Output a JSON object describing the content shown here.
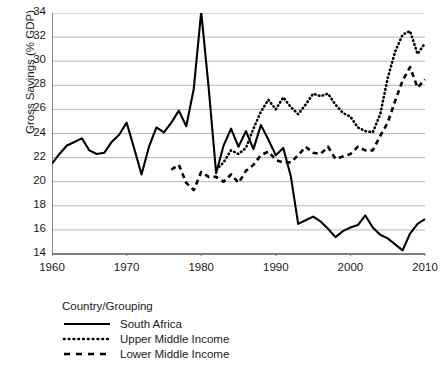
{
  "chart_data": {
    "type": "line",
    "title": "",
    "xlabel": "",
    "ylabel": "Gross Savings (% GDP)",
    "xlim": [
      1960,
      2010
    ],
    "ylim": [
      14,
      34
    ],
    "ytick_step": 2,
    "xtick_step": 10,
    "grid": "horizontal",
    "legend_position": "below-left",
    "legend_title": "Country/Grouping",
    "yticks": [
      "34",
      "32",
      "30",
      "28",
      "26",
      "24",
      "22",
      "20",
      "18",
      "16",
      "14"
    ],
    "xticks": [
      "1960",
      "1970",
      "1980",
      "1990",
      "2000",
      "2010"
    ],
    "series": [
      {
        "name": "South Africa",
        "style": "solid",
        "color": "#000000",
        "x": [
          1960,
          1961,
          1962,
          1963,
          1964,
          1965,
          1966,
          1967,
          1968,
          1969,
          1970,
          1971,
          1972,
          1973,
          1974,
          1975,
          1976,
          1977,
          1978,
          1979,
          1980,
          1981,
          1982,
          1983,
          1984,
          1985,
          1986,
          1987,
          1988,
          1989,
          1990,
          1991,
          1992,
          1993,
          1994,
          1995,
          1996,
          1997,
          1998,
          1999,
          2000,
          2001,
          2002,
          2003,
          2004,
          2005,
          2006,
          2007,
          2008,
          2009,
          2010
        ],
        "values": [
          21.5,
          22.3,
          23.0,
          23.3,
          23.6,
          22.6,
          22.3,
          22.4,
          23.3,
          23.9,
          24.9,
          22.8,
          20.6,
          22.9,
          24.5,
          24.1,
          24.9,
          25.9,
          24.6,
          27.7,
          34.1,
          27.8,
          20.7,
          23.0,
          24.4,
          22.9,
          24.2,
          22.7,
          24.7,
          23.5,
          22.2,
          22.8,
          20.5,
          16.5,
          16.8,
          17.1,
          16.7,
          16.1,
          15.4,
          15.9,
          16.2,
          16.4,
          17.2,
          16.2,
          15.6,
          15.3,
          14.8,
          14.3,
          15.7,
          16.5,
          16.9
        ]
      },
      {
        "name": "Upper Middle Income",
        "style": "dotted",
        "color": "#000000",
        "x": [
          1982,
          1983,
          1984,
          1985,
          1986,
          1987,
          1988,
          1989,
          1990,
          1991,
          1992,
          1993,
          1994,
          1995,
          1996,
          1997,
          1998,
          1999,
          2000,
          2001,
          2002,
          2003,
          2004,
          2005,
          2006,
          2007,
          2008,
          2009,
          2010
        ],
        "values": [
          21.0,
          21.6,
          22.6,
          22.3,
          22.8,
          24.4,
          25.8,
          26.8,
          26.0,
          27.0,
          26.2,
          25.6,
          26.4,
          27.3,
          27.1,
          27.3,
          26.4,
          25.7,
          25.4,
          24.5,
          24.2,
          24.1,
          25.6,
          28.6,
          30.8,
          32.2,
          32.5,
          30.6,
          31.5
        ]
      },
      {
        "name": "Lower Middle Income",
        "style": "dashed",
        "color": "#000000",
        "x": [
          1976,
          1977,
          1978,
          1979,
          1980,
          1981,
          1982,
          1983,
          1984,
          1985,
          1986,
          1987,
          1988,
          1989,
          1990,
          1991,
          1992,
          1993,
          1994,
          1995,
          1996,
          1997,
          1998,
          1999,
          2000,
          2001,
          2002,
          2003,
          2004,
          2005,
          2006,
          2007,
          2008,
          2009,
          2010
        ],
        "values": [
          21.0,
          21.4,
          19.9,
          19.3,
          20.8,
          20.4,
          20.4,
          20.0,
          20.6,
          19.9,
          20.9,
          21.4,
          22.2,
          22.5,
          21.8,
          21.6,
          21.6,
          22.2,
          22.9,
          22.4,
          22.3,
          22.9,
          21.9,
          22.1,
          22.3,
          22.9,
          22.6,
          22.6,
          23.8,
          24.9,
          26.7,
          28.4,
          29.5,
          27.8,
          28.5
        ]
      }
    ]
  },
  "legend": {
    "title": "Country/Grouping",
    "items": [
      {
        "label": "South Africa",
        "style": "solid"
      },
      {
        "label": "Upper Middle Income",
        "style": "dotted"
      },
      {
        "label": "Lower Middle Income",
        "style": "dashed"
      }
    ]
  }
}
